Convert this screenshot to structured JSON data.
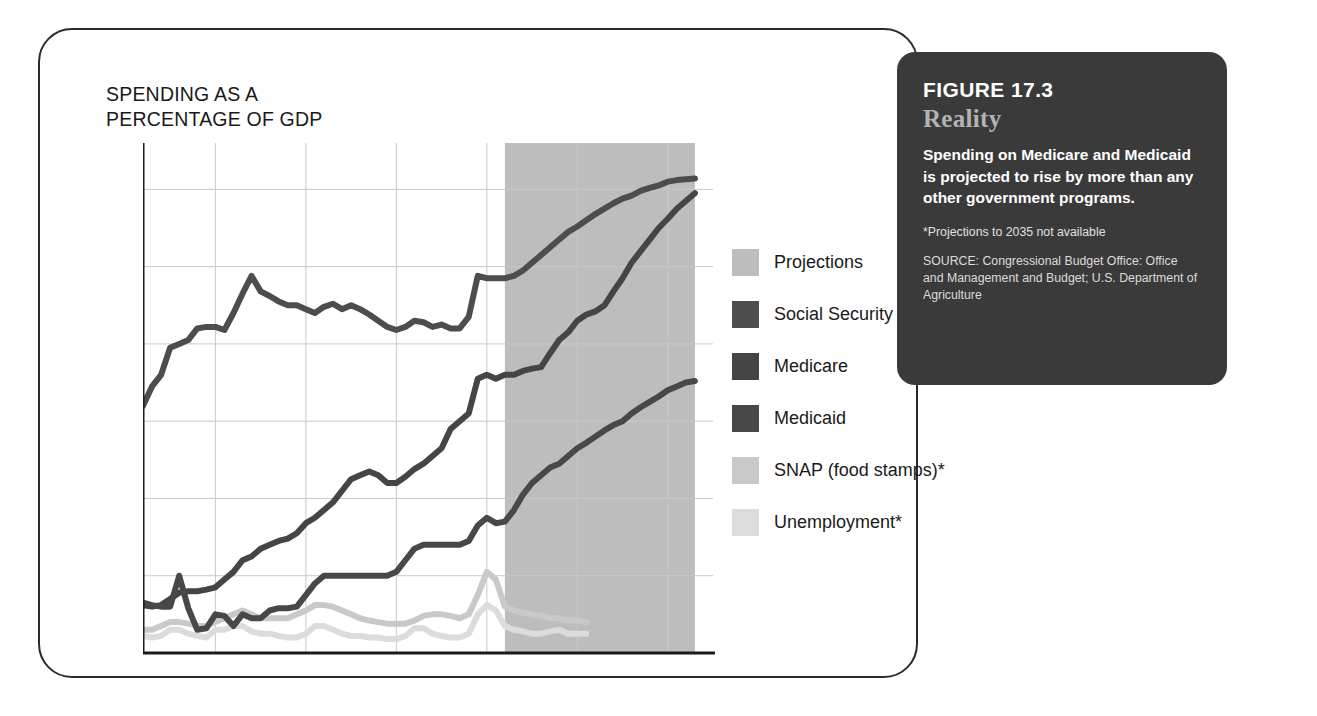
{
  "axis_title": "SPENDING AS A\nPERCENTAGE  OF GDP",
  "legend": {
    "items": [
      {
        "label": "Projections",
        "color": "#bdbdbd",
        "swatch_name": "legend-swatch-projections"
      },
      {
        "label": "Social Security",
        "color": "#4d4d4d",
        "swatch_name": "legend-swatch-social-security"
      },
      {
        "label": "Medicare",
        "color": "#454545",
        "swatch_name": "legend-swatch-medicare"
      },
      {
        "label": "Medicaid",
        "color": "#484848",
        "swatch_name": "legend-swatch-medicaid"
      },
      {
        "label": "SNAP (food stamps)*",
        "color": "#c9c9c9",
        "swatch_name": "legend-swatch-snap"
      },
      {
        "label": "Unemployment*",
        "color": "#dcdcdc",
        "swatch_name": "legend-swatch-unemployment"
      }
    ]
  },
  "callout": {
    "figure_number": "FIGURE 17.3",
    "kicker": "Reality",
    "body": "Spending on Medicare and Medicaid is projected to rise by more than any other government programs.",
    "footnote": "*Projections to 2035 not available",
    "source": "SOURCE: Congressional Budget Office: Office and Management and Budget; U.S. Department of Agriculture",
    "background_color": "#3a3a3a",
    "kicker_color": "#b3b3b3"
  },
  "chart_data": {
    "type": "line",
    "title": "SPENDING AS A PERCENTAGE OF GDP",
    "xlabel": "",
    "ylabel": "Spending as a percentage of GDP",
    "xlim": [
      1972,
      2035
    ],
    "ylim": [
      0,
      6.6
    ],
    "xticks": [
      1980,
      1990,
      2000,
      2010,
      2020,
      2030,
      2035
    ],
    "yticks": [
      1,
      2,
      3,
      4,
      5,
      6
    ],
    "grid": true,
    "legend_position": "right",
    "projection_band": {
      "label": "Projections",
      "start": 2012,
      "end": 2033,
      "color": "#bdbdbd"
    },
    "annotations": [
      "*Projections to 2035 not available"
    ],
    "series": [
      {
        "name": "Social Security",
        "color": "#4d4d4d",
        "x": [
          1972,
          1973,
          1974,
          1975,
          1976,
          1977,
          1978,
          1979,
          1980,
          1981,
          1982,
          1983,
          1984,
          1985,
          1986,
          1987,
          1988,
          1989,
          1990,
          1991,
          1992,
          1993,
          1994,
          1995,
          1996,
          1997,
          1998,
          1999,
          2000,
          2001,
          2002,
          2003,
          2004,
          2005,
          2006,
          2007,
          2008,
          2009,
          2010,
          2011,
          2012,
          2013,
          2014,
          2015,
          2016,
          2017,
          2018,
          2019,
          2020,
          2021,
          2022,
          2023,
          2024,
          2025,
          2026,
          2027,
          2028,
          2029,
          2030,
          2031,
          2032,
          2033
        ],
        "values": [
          3.2,
          3.45,
          3.6,
          3.95,
          4.0,
          4.05,
          4.2,
          4.22,
          4.22,
          4.18,
          4.4,
          4.65,
          4.88,
          4.68,
          4.62,
          4.55,
          4.5,
          4.5,
          4.45,
          4.4,
          4.48,
          4.52,
          4.45,
          4.5,
          4.45,
          4.38,
          4.3,
          4.22,
          4.18,
          4.22,
          4.3,
          4.28,
          4.22,
          4.25,
          4.2,
          4.2,
          4.35,
          4.88,
          4.85,
          4.85,
          4.85,
          4.88,
          4.95,
          5.05,
          5.15,
          5.25,
          5.35,
          5.45,
          5.52,
          5.6,
          5.68,
          5.75,
          5.82,
          5.88,
          5.92,
          5.98,
          6.02,
          6.05,
          6.1,
          6.12,
          6.13,
          6.14
        ]
      },
      {
        "name": "Medicare",
        "color": "#454545",
        "x": [
          1972,
          1973,
          1974,
          1975,
          1976,
          1977,
          1978,
          1979,
          1980,
          1981,
          1982,
          1983,
          1984,
          1985,
          1986,
          1987,
          1988,
          1989,
          1990,
          1991,
          1992,
          1993,
          1994,
          1995,
          1996,
          1997,
          1998,
          1999,
          2000,
          2001,
          2002,
          2003,
          2004,
          2005,
          2006,
          2007,
          2008,
          2009,
          2010,
          2011,
          2012,
          2013,
          2014,
          2015,
          2016,
          2017,
          2018,
          2019,
          2020,
          2021,
          2022,
          2023,
          2024,
          2025,
          2026,
          2027,
          2028,
          2029,
          2030,
          2031,
          2032,
          2033
        ],
        "values": [
          0.62,
          0.6,
          0.62,
          0.7,
          0.78,
          0.8,
          0.8,
          0.82,
          0.85,
          0.95,
          1.05,
          1.2,
          1.25,
          1.35,
          1.4,
          1.45,
          1.48,
          1.55,
          1.68,
          1.75,
          1.85,
          1.95,
          2.1,
          2.25,
          2.3,
          2.35,
          2.3,
          2.2,
          2.2,
          2.28,
          2.38,
          2.45,
          2.55,
          2.65,
          2.9,
          3.0,
          3.1,
          3.55,
          3.6,
          3.55,
          3.6,
          3.6,
          3.65,
          3.68,
          3.7,
          3.88,
          4.05,
          4.15,
          4.3,
          4.38,
          4.42,
          4.5,
          4.68,
          4.85,
          5.05,
          5.2,
          5.35,
          5.5,
          5.62,
          5.75,
          5.85,
          5.95
        ]
      },
      {
        "name": "Medicaid",
        "color": "#484848",
        "x": [
          1972,
          1973,
          1974,
          1975,
          1976,
          1977,
          1978,
          1979,
          1980,
          1981,
          1982,
          1983,
          1984,
          1985,
          1986,
          1987,
          1988,
          1989,
          1990,
          1991,
          1992,
          1993,
          1994,
          1995,
          1996,
          1997,
          1998,
          1999,
          2000,
          2001,
          2002,
          2003,
          2004,
          2005,
          2006,
          2007,
          2008,
          2009,
          2010,
          2011,
          2012,
          2013,
          2014,
          2015,
          2016,
          2017,
          2018,
          2019,
          2020,
          2021,
          2022,
          2023,
          2024,
          2025,
          2026,
          2027,
          2028,
          2029,
          2030,
          2031,
          2032,
          2033
        ],
        "values": [
          0.65,
          0.62,
          0.6,
          0.6,
          1.0,
          0.58,
          0.3,
          0.32,
          0.5,
          0.48,
          0.35,
          0.5,
          0.45,
          0.45,
          0.55,
          0.58,
          0.58,
          0.6,
          0.75,
          0.9,
          1.0,
          1.0,
          1.0,
          1.0,
          1.0,
          1.0,
          1.0,
          1.0,
          1.05,
          1.2,
          1.35,
          1.4,
          1.4,
          1.4,
          1.4,
          1.4,
          1.45,
          1.65,
          1.75,
          1.68,
          1.7,
          1.85,
          2.05,
          2.2,
          2.3,
          2.4,
          2.45,
          2.55,
          2.65,
          2.72,
          2.8,
          2.88,
          2.95,
          3.0,
          3.1,
          3.18,
          3.25,
          3.32,
          3.4,
          3.45,
          3.5,
          3.52
        ]
      },
      {
        "name": "SNAP (food stamps)*",
        "color": "#c9c9c9",
        "x": [
          1972,
          1973,
          1974,
          1975,
          1976,
          1977,
          1978,
          1979,
          1980,
          1981,
          1982,
          1983,
          1984,
          1985,
          1986,
          1987,
          1988,
          1989,
          1990,
          1991,
          1992,
          1993,
          1994,
          1995,
          1996,
          1997,
          1998,
          1999,
          2000,
          2001,
          2002,
          2003,
          2004,
          2005,
          2006,
          2007,
          2008,
          2009,
          2010,
          2011,
          2012,
          2013,
          2014,
          2015,
          2016,
          2017,
          2018,
          2019,
          2020,
          2021
        ],
        "values": [
          0.3,
          0.3,
          0.35,
          0.4,
          0.4,
          0.38,
          0.35,
          0.35,
          0.4,
          0.45,
          0.5,
          0.55,
          0.5,
          0.45,
          0.45,
          0.45,
          0.45,
          0.5,
          0.55,
          0.62,
          0.62,
          0.6,
          0.55,
          0.5,
          0.45,
          0.42,
          0.4,
          0.38,
          0.38,
          0.38,
          0.42,
          0.48,
          0.5,
          0.5,
          0.48,
          0.45,
          0.5,
          0.75,
          1.05,
          0.95,
          0.6,
          0.55,
          0.52,
          0.5,
          0.48,
          0.45,
          0.45,
          0.42,
          0.42,
          0.4
        ]
      },
      {
        "name": "Unemployment*",
        "color": "#dcdcdc",
        "x": [
          1972,
          1973,
          1974,
          1975,
          1976,
          1977,
          1978,
          1979,
          1980,
          1981,
          1982,
          1983,
          1984,
          1985,
          1986,
          1987,
          1988,
          1989,
          1990,
          1991,
          1992,
          1993,
          1994,
          1995,
          1996,
          1997,
          1998,
          1999,
          2000,
          2001,
          2002,
          2003,
          2004,
          2005,
          2006,
          2007,
          2008,
          2009,
          2010,
          2011,
          2012,
          2013,
          2014,
          2015,
          2016,
          2017,
          2018,
          2019,
          2020,
          2021
        ],
        "values": [
          0.22,
          0.2,
          0.22,
          0.3,
          0.3,
          0.25,
          0.22,
          0.2,
          0.3,
          0.3,
          0.35,
          0.35,
          0.28,
          0.25,
          0.25,
          0.22,
          0.2,
          0.2,
          0.25,
          0.35,
          0.35,
          0.3,
          0.25,
          0.22,
          0.22,
          0.2,
          0.2,
          0.18,
          0.18,
          0.22,
          0.32,
          0.32,
          0.25,
          0.22,
          0.2,
          0.2,
          0.25,
          0.5,
          0.62,
          0.55,
          0.35,
          0.3,
          0.28,
          0.25,
          0.25,
          0.28,
          0.3,
          0.25,
          0.25,
          0.25
        ]
      }
    ]
  }
}
